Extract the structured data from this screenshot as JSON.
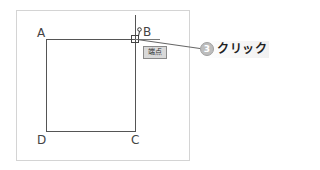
{
  "diagram": {
    "vertices": {
      "a": "A",
      "b": "B",
      "c": "C",
      "d": "D"
    },
    "snap_tooltip": "端点",
    "cursor_icon": "pen-cursor-icon",
    "snap_marker_icon": "square-snap-marker-icon"
  },
  "callout": {
    "step_number": "3",
    "action": "クリック"
  },
  "colors": {
    "line": "#555555",
    "panel_border": "#d4d4d4",
    "tooltip_bg": "#d9d9d9",
    "badge_bg": "#bdbdbd",
    "leader": "#666666"
  }
}
